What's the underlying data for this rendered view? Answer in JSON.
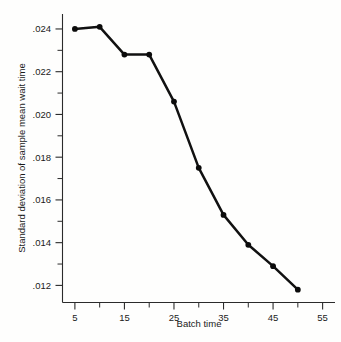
{
  "chart_data": {
    "type": "line",
    "title": "",
    "xlabel": "Batch time",
    "ylabel": "Standard deviation of sample mean wait time",
    "x": [
      5,
      10,
      15,
      20,
      25,
      30,
      35,
      40,
      45,
      50
    ],
    "values": [
      0.024,
      0.0241,
      0.0228,
      0.0228,
      0.0206,
      0.0175,
      0.0153,
      0.0139,
      0.0129,
      0.0118
    ],
    "series": [
      {
        "name": "Standard deviation of sample mean wait time",
        "values": [
          0.024,
          0.0241,
          0.0228,
          0.0228,
          0.0206,
          0.0175,
          0.0153,
          0.0139,
          0.0129,
          0.0118
        ]
      }
    ],
    "xlim": [
      2.5,
      57.5
    ],
    "ylim": [
      0.0112,
      0.0247
    ],
    "grid": false,
    "legend": "none",
    "markers": "filled-circle",
    "x_ticks_major": [
      5,
      15,
      25,
      35,
      45,
      55
    ],
    "x_ticks_minor": [
      10,
      20,
      30,
      40,
      50
    ],
    "x_tick_labels": [
      "5",
      "15",
      "25",
      "35",
      "45",
      "55"
    ],
    "y_ticks_major": [
      0.024,
      0.022,
      0.02,
      0.018,
      0.016,
      0.014,
      0.012
    ],
    "y_ticks_minor": [
      0.023,
      0.021,
      0.019,
      0.017,
      0.015,
      0.013
    ],
    "y_tick_labels": [
      ".024",
      ".022",
      ".020",
      ".018",
      ".016",
      ".014",
      ".012"
    ]
  },
  "axes": {
    "x_axis_title": "Batch time",
    "y_axis_title": "Standard deviation of sample mean wait time"
  }
}
